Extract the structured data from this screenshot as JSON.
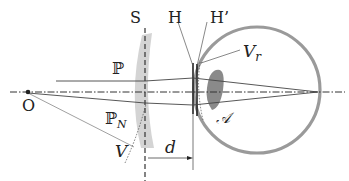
{
  "diagram": {
    "colors": {
      "line": "#333333",
      "thin_line": "#555555",
      "lens_fill": "#d4d4d4",
      "eye_outline": "#9a9a9a",
      "crystalline_lens": "#8a8a8a",
      "background": "#ffffff"
    },
    "labels": {
      "S": "S",
      "H": "H",
      "H_prime": "H’",
      "V_r": "V",
      "V_r_sub": "r",
      "P": "ℙ",
      "P_N": "ℙ",
      "P_N_sub": "N",
      "O": "O",
      "V": "V",
      "d": "d",
      "A": "𝒜"
    },
    "elements": [
      "optical-axis",
      "spectacle-lens",
      "plane-S",
      "principal-plane-H",
      "principal-plane-H-prime",
      "eyeball",
      "crystalline-lens",
      "ray-P",
      "ray-P-N",
      "distance-d-arrow"
    ]
  }
}
